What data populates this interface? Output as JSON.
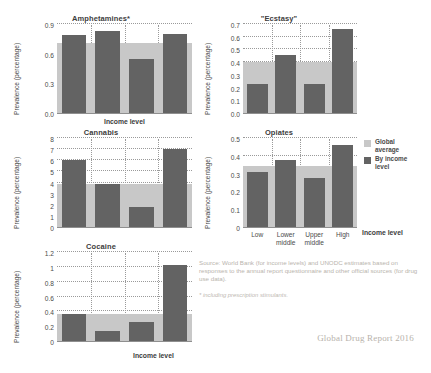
{
  "figure": {
    "cut_top_text": "",
    "source_note": "Source: World Bank (for income levels) and UNODC estimates based on responses to the annual report questionnaire and other official sources (for drug use data).",
    "footnote": "* including prescription stimulants.",
    "credit": "Global Drug Report 2016",
    "colors": {
      "by_income_level": "#636363",
      "global_average": "#c8c8c8",
      "grid": "#9a9a9a",
      "axis": "#8f8f8f",
      "text": "#4a4a4a",
      "muted_text": "#b9b4ad"
    }
  },
  "legend": {
    "position": "right",
    "entries": [
      {
        "label_line1": "Global",
        "label_line2": "average",
        "color": "#c8c8c8",
        "key": "global-average"
      },
      {
        "label_line1": "By income",
        "label_line2": "level",
        "color": "#636363",
        "key": "by-income-level"
      }
    ]
  },
  "chart_data": [
    {
      "type": "bar",
      "title": "Amphetamines*",
      "xlabel": "Income level",
      "ylabel": "Prevalence (percentage)",
      "categories": [
        "Low",
        "Lower middle",
        "Upper middle",
        "High"
      ],
      "series": [
        {
          "name": "By income level",
          "values": [
            0.79,
            0.83,
            0.55,
            0.8
          ]
        }
      ],
      "global_average": 0.71,
      "ylim": [
        0.0,
        0.9
      ],
      "yticks": [
        0.0,
        0.3,
        0.6,
        0.9
      ],
      "ytick_labels": [
        "0.0",
        "0.3",
        "0.6",
        "0.9"
      ],
      "grid": true,
      "xtick_labels_shown": false
    },
    {
      "type": "bar",
      "title": "\"Ecstasy\"",
      "xlabel": "Income level",
      "ylabel": "Prevalence (percentage)",
      "categories": [
        "Low",
        "Lower middle",
        "Upper middle",
        "High"
      ],
      "series": [
        {
          "name": "By income level",
          "values": [
            0.23,
            0.46,
            0.23,
            0.66
          ]
        }
      ],
      "global_average": 0.4,
      "ylim": [
        0.0,
        0.7
      ],
      "yticks": [
        0.0,
        0.1,
        0.2,
        0.3,
        0.4,
        0.5,
        0.6,
        0.7
      ],
      "ytick_labels": [
        "0.0",
        "0.1",
        "0.2",
        "0.3",
        "0.4",
        "0.5",
        "0.6",
        "0.7"
      ],
      "grid": true,
      "xtick_labels_shown": false
    },
    {
      "type": "bar",
      "title": "Cannabis",
      "xlabel": "Income level",
      "ylabel": "Prevalence (percentage)",
      "categories": [
        "Low",
        "Lower middle",
        "Upper middle",
        "High"
      ],
      "series": [
        {
          "name": "By income level",
          "values": [
            6.05,
            3.9,
            1.8,
            7.0
          ]
        }
      ],
      "global_average": 3.85,
      "ylim": [
        0,
        8
      ],
      "yticks": [
        0,
        1,
        2,
        3,
        4,
        5,
        6,
        7,
        8
      ],
      "ytick_labels": [
        "0",
        "1",
        "2",
        "3",
        "4",
        "5",
        "6",
        "7",
        "8"
      ],
      "grid": true,
      "xtick_labels_shown": false
    },
    {
      "type": "bar",
      "title": "Opiates",
      "xlabel": "Income level",
      "ylabel": "Prevalence (percentage)",
      "categories": [
        "Low",
        "Lower middle",
        "Upper middle",
        "High"
      ],
      "series": [
        {
          "name": "By income level",
          "values": [
            0.31,
            0.375,
            0.275,
            0.46
          ]
        }
      ],
      "global_average": 0.345,
      "ylim": [
        0.0,
        0.5
      ],
      "yticks": [
        0.0,
        0.1,
        0.2,
        0.3,
        0.4,
        0.5
      ],
      "ytick_labels": [
        "0",
        "0.1",
        "0.2",
        "0.3",
        "0.4",
        "0.5"
      ],
      "grid": true,
      "xtick_labels_shown": true
    },
    {
      "type": "bar",
      "title": "Cocaine",
      "xlabel": "Income level",
      "ylabel": "Prevalence (percentage)",
      "categories": [
        "Low",
        "Lower middle",
        "Upper middle",
        "High"
      ],
      "series": [
        {
          "name": "By income level",
          "values": [
            0.36,
            0.13,
            0.26,
            1.02
          ]
        }
      ],
      "global_average": 0.36,
      "ylim": [
        0,
        1.2
      ],
      "yticks": [
        0,
        0.2,
        0.4,
        0.6,
        0.8,
        1.0,
        1.2
      ],
      "ytick_labels": [
        "0",
        "0.2",
        "0.4",
        "0.6",
        "0.8",
        "1",
        "1.2"
      ],
      "grid": true,
      "xtick_labels_shown": false
    }
  ]
}
